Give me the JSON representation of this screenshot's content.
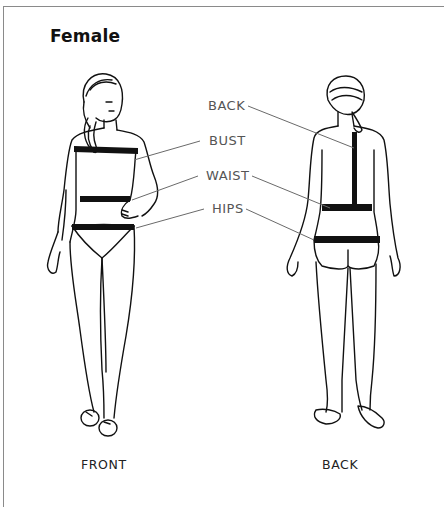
{
  "title": "Female",
  "measurements": [
    {
      "id": "back",
      "label": "BACK"
    },
    {
      "id": "bust",
      "label": "BUST"
    },
    {
      "id": "waist",
      "label": "WAIST"
    },
    {
      "id": "hips",
      "label": "HIPS"
    }
  ],
  "views": {
    "front": "FRONT",
    "back": "BACK"
  },
  "colors": {
    "line": "#111111",
    "leader": "#6a6a6a",
    "band": "#111111",
    "label": "#555555"
  }
}
